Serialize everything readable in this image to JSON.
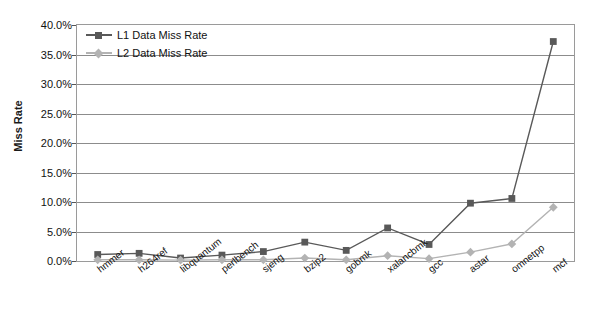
{
  "chart_data": {
    "type": "line",
    "title": "",
    "xlabel": "",
    "ylabel": "Miss Rate",
    "ylim": [
      0,
      40
    ],
    "ytick_labels": [
      "0.0%",
      "5.0%",
      "10.0%",
      "15.0%",
      "20.0%",
      "25.0%",
      "30.0%",
      "35.0%",
      "40.0%"
    ],
    "ytick_values": [
      0,
      5,
      10,
      15,
      20,
      25,
      30,
      35,
      40
    ],
    "grid": true,
    "legend_position": "top-left",
    "categories": [
      "hmmer",
      "h264ref",
      "libquantum",
      "perlbench",
      "sjeng",
      "bzip2",
      "gobmk",
      "xalancbmk",
      "gcc",
      "astar",
      "omnetpp",
      "mcf"
    ],
    "series": [
      {
        "name": "L1 Data Miss Rate",
        "color": "#595959",
        "marker": "square",
        "values": [
          1.1,
          1.3,
          0.5,
          1.0,
          1.6,
          3.2,
          1.8,
          5.6,
          2.8,
          9.8,
          10.6,
          37.2
        ]
      },
      {
        "name": "L2 Data Miss Rate",
        "color": "#b3b3b3",
        "marker": "diamond",
        "values": [
          0.2,
          0.2,
          0.15,
          0.2,
          0.2,
          0.5,
          0.2,
          0.9,
          0.4,
          1.5,
          2.9,
          9.1
        ]
      }
    ]
  },
  "axis": {
    "y_title": "Miss Rate"
  },
  "colors": {
    "series1": "#595959",
    "series2": "#b3b3b3",
    "gridline": "#8c8c8c",
    "border": "#9a9a9a",
    "text": "#111111"
  }
}
